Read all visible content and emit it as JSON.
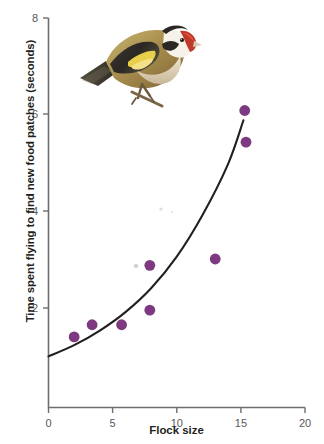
{
  "figure": {
    "kind": "scatter-with-fitted-curve",
    "illustration": {
      "name": "european-goldfinch",
      "caption": "European goldfinch illustration"
    }
  },
  "chart_data": {
    "type": "scatter",
    "title": "",
    "xlabel": "Flock size",
    "ylabel": "Time spent flying to find new food patches (seconds)",
    "xlim": [
      0,
      20
    ],
    "ylim": [
      0,
      8
    ],
    "xticks": [
      0,
      5,
      10,
      15,
      20
    ],
    "yticks": [
      2,
      4,
      6,
      8
    ],
    "xticklabels": [
      "0",
      "5",
      "10",
      "15",
      "20"
    ],
    "yticklabels": [
      "2",
      "4",
      "6",
      "8"
    ],
    "grid": false,
    "legend": false,
    "marker_color": "#7E3A80",
    "curve_color": "#231f20",
    "axis_color": "#6d6e71",
    "points": [
      {
        "x": 2.0,
        "y": 1.45
      },
      {
        "x": 3.4,
        "y": 1.7
      },
      {
        "x": 5.7,
        "y": 1.7
      },
      {
        "x": 7.9,
        "y": 2.0
      },
      {
        "x": 7.9,
        "y": 2.92
      },
      {
        "x": 13.0,
        "y": 3.05
      },
      {
        "x": 15.3,
        "y": 6.1
      },
      {
        "x": 15.4,
        "y": 5.45
      }
    ],
    "fit": {
      "description": "exponential trend line",
      "x_start": 0.0,
      "y_start": 1.05,
      "x_end": 15.2,
      "y_end": 5.9,
      "path_points": [
        {
          "x": 0.0,
          "y": 1.05
        },
        {
          "x": 2.0,
          "y": 1.28
        },
        {
          "x": 4.0,
          "y": 1.58
        },
        {
          "x": 6.0,
          "y": 1.96
        },
        {
          "x": 8.0,
          "y": 2.45
        },
        {
          "x": 10.0,
          "y": 3.1
        },
        {
          "x": 12.0,
          "y": 3.95
        },
        {
          "x": 14.0,
          "y": 5.0
        },
        {
          "x": 15.2,
          "y": 5.9
        }
      ]
    }
  }
}
